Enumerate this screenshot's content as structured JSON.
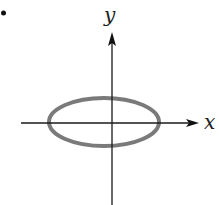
{
  "figure": {
    "bullet": "•",
    "x_axis_label": "x",
    "y_axis_label": "y"
  },
  "colors": {
    "axis": "#1a1a1a",
    "ellipse": "#7a7a7a",
    "background": "#ffffff"
  },
  "geometry": {
    "origin": [
      112,
      123
    ],
    "ellipse": {
      "cx": 104,
      "cy": 122,
      "rx": 55,
      "ry": 24,
      "stroke_width": 4
    },
    "x_axis": {
      "x1": 21,
      "x2": 198,
      "y": 123
    },
    "y_axis": {
      "x": 112,
      "y1": 205,
      "y2": 32
    }
  }
}
